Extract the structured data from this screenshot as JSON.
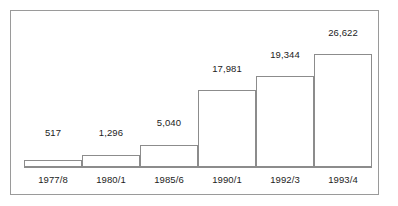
{
  "chart_data": {
    "type": "bar",
    "title": "",
    "subtitle": "",
    "xlabel": "",
    "ylabel": "",
    "grid": false,
    "legend": false,
    "legend_position": "none",
    "orientation": "vertical",
    "categories": [
      "1977/8",
      "1980/1",
      "1985/6",
      "1990/1",
      "1992/3",
      "1993/4"
    ],
    "values": [
      517,
      1296,
      5040,
      17981,
      19344,
      26622
    ],
    "value_labels": [
      "517",
      "1,296",
      "5,040",
      "17,981",
      "19,344",
      "26,622"
    ],
    "ylim": [
      0,
      28000
    ],
    "axis_visible": {
      "x": true,
      "y": false
    },
    "bar_style": {
      "fill": "#ffffff",
      "stroke": "#8c8c8c",
      "adjacent": true
    },
    "frame": {
      "stroke": "#9a9a9a",
      "fill": "#ffffff"
    },
    "text_color": "#1c1c1c"
  },
  "bars": [
    {
      "category": "1977/8",
      "value": 517,
      "label": "517",
      "left": 13,
      "width": 58,
      "top": 149,
      "height": 7
    },
    {
      "category": "1980/1",
      "value": 1296,
      "label": "1,296",
      "left": 71,
      "width": 58,
      "top": 144,
      "height": 12
    },
    {
      "category": "1985/6",
      "value": 5040,
      "label": "5,040",
      "left": 129,
      "width": 58,
      "top": 134,
      "height": 22
    },
    {
      "category": "1990/1",
      "value": 17981,
      "label": "17,981",
      "left": 187,
      "width": 58,
      "top": 79,
      "height": 77
    },
    {
      "category": "1992/3",
      "value": 19344,
      "label": "19,344",
      "left": 245,
      "width": 58,
      "top": 65,
      "height": 91
    },
    {
      "category": "1993/4",
      "value": 26622,
      "label": "26,622",
      "left": 303,
      "width": 58,
      "top": 43,
      "height": 113
    }
  ],
  "value_label_positions": [
    {
      "text": "517",
      "left": 13,
      "width": 58,
      "top": 116
    },
    {
      "text": "1,296",
      "left": 71,
      "width": 58,
      "top": 116
    },
    {
      "text": "5,040",
      "left": 129,
      "width": 58,
      "top": 106
    },
    {
      "text": "17,981",
      "left": 187,
      "width": 58,
      "top": 52
    },
    {
      "text": "19,344",
      "left": 245,
      "width": 58,
      "top": 38
    },
    {
      "text": "26,622",
      "left": 303,
      "width": 58,
      "top": 16
    }
  ],
  "category_label_positions": [
    {
      "text": "1977/8",
      "left": 13,
      "width": 58,
      "top": 163
    },
    {
      "text": "1980/1",
      "left": 71,
      "width": 58,
      "top": 163
    },
    {
      "text": "1985/6",
      "left": 129,
      "width": 58,
      "top": 163
    },
    {
      "text": "1990/1",
      "left": 187,
      "width": 58,
      "top": 163
    },
    {
      "text": "1992/3",
      "left": 245,
      "width": 58,
      "top": 163
    },
    {
      "text": "1993/4",
      "left": 303,
      "width": 58,
      "top": 163
    }
  ],
  "baseline": {
    "left": 13,
    "width": 348,
    "top": 156,
    "thickness": 1
  }
}
